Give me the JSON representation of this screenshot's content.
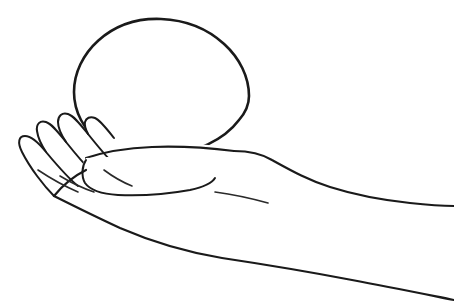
{
  "image": {
    "title": "Open hand holding a sphere",
    "description": "Black line drawing on a white background of a human hand, palm up and seen from the side, with the forearm extending to the right edge. A large circle rests on the palm.",
    "style": "pen-and-ink contour line drawing",
    "background_color": "#ffffff",
    "ink_color": "#1a1a1a",
    "width": 454,
    "height": 306
  },
  "subjects": [
    {
      "name": "sphere",
      "label": "Sphere",
      "shape": "circle",
      "center_x": 161,
      "center_y": 85,
      "radius_x": 88,
      "radius_y": 66,
      "bounds": {
        "left": 73,
        "top": 19,
        "right": 249,
        "bottom": 151
      },
      "occluded_by": "palm"
    },
    {
      "name": "hand",
      "label": "Hand",
      "orientation": "palm up, fingers to the left",
      "visible_fingers": 4,
      "thumb_visible": true
    },
    {
      "name": "forearm",
      "label": "Forearm",
      "direction": "extends to the right edge of the frame",
      "exits_frame_at_x": 454
    }
  ],
  "fingers": [
    {
      "name": "finger-1",
      "label": "Little finger",
      "tip_x": 19,
      "tip_y": 143
    },
    {
      "name": "finger-2",
      "label": "Ring finger",
      "tip_x": 38,
      "tip_y": 128
    },
    {
      "name": "finger-3",
      "label": "Middle finger",
      "tip_x": 62,
      "tip_y": 124
    },
    {
      "name": "finger-4",
      "label": "Index finger",
      "tip_x": 86,
      "tip_y": 135
    }
  ],
  "geometry": {
    "sphere_outline": "M 249 96 C 249 58 212 21 161 19 C 110 17 74 54 74 92 C 74 112 84 130 100 142 C 116 153 140 158 164 156 C 196 153 224 140 239 120 C 246 112 249 104 249 96 Z",
    "back_of_hand": "M 234 151 C 248 151 262 154 272 160 C 292 171 308 180 330 187 C 352 194 382 200 410 203 C 428 205 442 206 454 206",
    "palm_underside": "M 86 170 C 74 176 62 186 54 196 C 70 204 94 216 120 228 C 150 241 186 252 222 258 C 262 264 310 272 352 280 C 390 287 424 294 454 300",
    "wrist_front": "M 215 192 C 230 194 250 198 268 203",
    "thumb_outline": "M 86 160 C 82 166 81 176 85 183 C 90 190 102 194 118 195 C 140 196 168 194 190 190 C 204 187 212 183 215 178",
    "palm_top_ridge": "M 86 158 C 104 152 128 148 152 147 C 180 146 210 148 234 151",
    "finger_1": "M 54 196 C 44 186 30 168 22 152 C 17 142 19 136 25 136 C 31 136 38 142 46 152 C 56 164 68 178 78 186",
    "finger_2": "M 46 152 C 42 146 38 138 37 131 C 36 124 40 120 46 122 C 52 124 58 132 66 142 C 74 152 84 164 92 172",
    "finger_3": "M 66 142 C 62 136 58 128 58 122 C 58 116 62 112 68 114 C 74 116 80 124 88 134 C 96 144 104 154 112 162",
    "finger_4": "M 88 134 C 86 130 84 126 85 122 C 86 118 90 116 95 118 C 100 120 106 128 114 138",
    "palm_crease_1": "M 38 170 C 50 178 64 186 78 192",
    "palm_crease_2": "M 60 176 C 70 182 82 188 94 192",
    "knuckle_mark": "M 104 170 C 112 176 122 182 132 186"
  },
  "annotations": {
    "line_quality": "hand-drawn, slightly wavering single-weight contour",
    "shading": "none",
    "fill": "unfilled white interiors"
  }
}
